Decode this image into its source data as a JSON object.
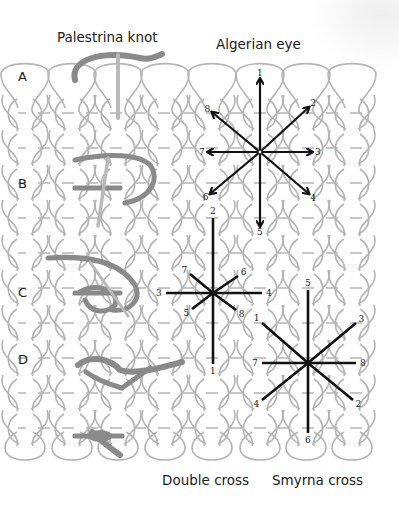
{
  "titles": {
    "palestrina": "Palestrina knot",
    "algerian": "Algerian eye",
    "double_cross": "Double cross",
    "smyrna": "Smyrna  cross"
  },
  "row_labels": [
    "A",
    "B",
    "C",
    "D"
  ],
  "colors": {
    "grid": "#b4b4b4",
    "stitch_line": "#111111",
    "thread": "#8a8a8a",
    "thread_light": "#b9b9b9"
  },
  "grid": {
    "columns_x": [
      25,
      72,
      118,
      165,
      212,
      260,
      306,
      352
    ],
    "rows_y": [
      113,
      148,
      183,
      218,
      253,
      288,
      323,
      358,
      393,
      428
    ]
  },
  "algerian_eye": {
    "center": [
      260,
      152
    ],
    "arrows": [
      {
        "n": "1",
        "to": [
          260,
          80
        ]
      },
      {
        "n": "2",
        "to": [
          308,
          108
        ]
      },
      {
        "n": "3",
        "to": [
          311,
          152
        ]
      },
      {
        "n": "4",
        "to": [
          308,
          193
        ]
      },
      {
        "n": "5",
        "to": [
          260,
          225
        ]
      },
      {
        "n": "6",
        "to": [
          211,
          193
        ]
      },
      {
        "n": "7",
        "to": [
          209,
          152
        ]
      },
      {
        "n": "8",
        "to": [
          213,
          113
        ]
      }
    ]
  },
  "double_cross": {
    "center": [
      213,
      293
    ],
    "lines": [
      {
        "n": "2",
        "from": [
          213,
          293
        ],
        "to": [
          213,
          218
        ]
      },
      {
        "n": "1",
        "from": [
          213,
          293
        ],
        "to": [
          213,
          364
        ]
      },
      {
        "n": "3",
        "from": [
          213,
          293
        ],
        "to": [
          166,
          293
        ]
      },
      {
        "n": "4",
        "from": [
          213,
          293
        ],
        "to": [
          262,
          293
        ]
      },
      {
        "n": "7",
        "from": [
          213,
          293
        ],
        "to": [
          190,
          274
        ]
      },
      {
        "n": "6",
        "from": [
          213,
          293
        ],
        "to": [
          238,
          276
        ]
      },
      {
        "n": "5",
        "from": [
          213,
          293
        ],
        "to": [
          192,
          309
        ]
      },
      {
        "n": "8",
        "from": [
          213,
          293
        ],
        "to": [
          236,
          310
        ]
      }
    ]
  },
  "smyrna_cross": {
    "center": [
      308,
      363
    ],
    "lines": [
      {
        "n": "5",
        "from": [
          308,
          363
        ],
        "to": [
          308,
          290
        ]
      },
      {
        "n": "6",
        "from": [
          308,
          363
        ],
        "to": [
          308,
          433
        ]
      },
      {
        "n": "1",
        "from": [
          308,
          363
        ],
        "to": [
          262,
          323
        ]
      },
      {
        "n": "2",
        "from": [
          308,
          363
        ],
        "to": [
          353,
          400
        ]
      },
      {
        "n": "3",
        "from": [
          308,
          363
        ],
        "to": [
          356,
          323
        ]
      },
      {
        "n": "4",
        "from": [
          308,
          363
        ],
        "to": [
          262,
          400
        ]
      },
      {
        "n": "7",
        "from": [
          308,
          363
        ],
        "to": [
          262,
          363
        ]
      },
      {
        "n": "8",
        "from": [
          308,
          363
        ],
        "to": [
          356,
          363
        ]
      }
    ]
  }
}
